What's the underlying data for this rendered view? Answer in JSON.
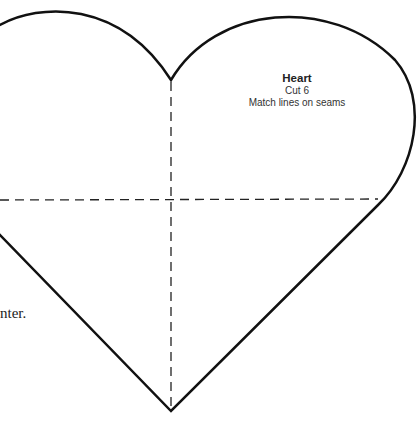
{
  "pattern": {
    "name": "Heart",
    "cut_instruction": "Cut 6",
    "seam_note": "Match lines on seams",
    "outline_color": "#111111",
    "guide_color": "#222222"
  },
  "side_text": "nter."
}
